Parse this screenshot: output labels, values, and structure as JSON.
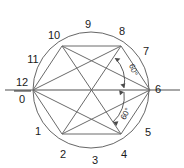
{
  "figure": {
    "center": {
      "x": 91,
      "y": 90
    },
    "radius": 58,
    "colors": {
      "outline": "#555555",
      "axis": "#8a8a8a",
      "hexagon": "#6a6a6a",
      "label": "#1a1a1a",
      "background": "#ffffff"
    }
  },
  "clock_labels": [
    {
      "id": "label-12",
      "text": "12",
      "x": 22,
      "y": 83
    },
    {
      "id": "label-0",
      "text": "0",
      "x": 22,
      "y": 99
    },
    {
      "id": "label-1",
      "text": "1",
      "x": 38,
      "y": 132
    },
    {
      "id": "label-2",
      "text": "2",
      "x": 63,
      "y": 155
    },
    {
      "id": "label-3",
      "text": "3",
      "x": 95,
      "y": 161
    },
    {
      "id": "label-4",
      "text": "4",
      "x": 124,
      "y": 155
    },
    {
      "id": "label-5",
      "text": "5",
      "x": 148,
      "y": 133
    },
    {
      "id": "label-6",
      "text": "6",
      "x": 158,
      "y": 90
    },
    {
      "id": "label-7",
      "text": "7",
      "x": 146,
      "y": 52
    },
    {
      "id": "label-8",
      "text": "8",
      "x": 122,
      "y": 32
    },
    {
      "id": "label-9",
      "text": "9",
      "x": 88,
      "y": 25
    },
    {
      "id": "label-10",
      "text": "10",
      "x": 54,
      "y": 36
    },
    {
      "id": "label-11",
      "text": "11",
      "x": 33,
      "y": 60
    }
  ],
  "angle_annotations": [
    {
      "id": "angle-upper",
      "text": "60°",
      "x": 133,
      "y": 70,
      "rotation": 72
    },
    {
      "id": "angle-lower",
      "text": "60°",
      "x": 126,
      "y": 114,
      "rotation": -62
    }
  ],
  "hexagon_vertices": [
    {
      "name": "vertex-0",
      "x": 33,
      "y": 90
    },
    {
      "name": "vertex-10",
      "x": 62,
      "y": 46
    },
    {
      "name": "vertex-8",
      "x": 121,
      "y": 46
    },
    {
      "name": "vertex-6",
      "x": 150,
      "y": 90
    },
    {
      "name": "vertex-4",
      "x": 121,
      "y": 134
    },
    {
      "name": "vertex-2",
      "x": 62,
      "y": 134
    }
  ],
  "axis_line": {
    "x1": 5,
    "y1": 90,
    "x2": 180,
    "y2": 90
  },
  "fraction_bar": {
    "x1": 14,
    "y1": 91,
    "x2": 31,
    "y2": 91
  }
}
